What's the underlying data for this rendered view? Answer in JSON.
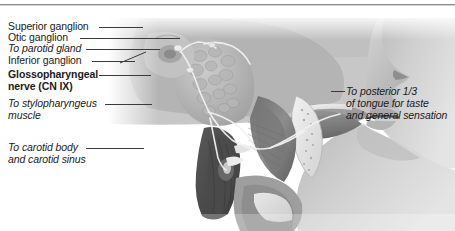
{
  "figure": {
    "type": "anatomical-illustration",
    "rendering": "grayscale sagittal section of head and neck showing facial profile, tongue, pharynx and nerve pathways"
  },
  "labels": {
    "left": [
      {
        "text": "Superior ganglion",
        "style": "regular"
      },
      {
        "text": "Otic ganglion",
        "style": "regular"
      },
      {
        "text": "To parotid gland",
        "style": "italic"
      },
      {
        "text": "Inferior ganglion",
        "style": "regular"
      },
      {
        "text": "Glossopharyngeal",
        "style": "bold"
      },
      {
        "text": "nerve (CN IX)",
        "style": "bold"
      },
      {
        "text": "To stylopharyngeus",
        "style": "italic"
      },
      {
        "text": "muscle",
        "style": "italic"
      },
      {
        "text": "To carotid body",
        "style": "italic"
      },
      {
        "text": "and carotid sinus",
        "style": "italic"
      }
    ],
    "right": [
      {
        "text": "To posterior 1/3",
        "style": "italic"
      },
      {
        "text": "of tongue for taste",
        "style": "italic"
      },
      {
        "text": "and general sensation",
        "style": "italic"
      }
    ]
  },
  "colors": {
    "text": "#1b1b1b",
    "leader": "#3b3b3b",
    "rule": "#8a8a8f",
    "background": "#ffffff"
  }
}
